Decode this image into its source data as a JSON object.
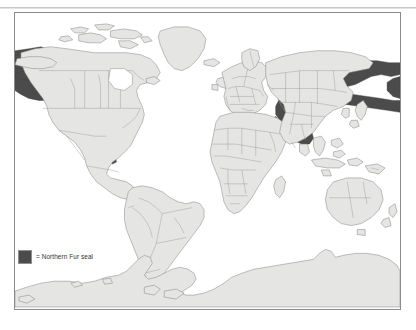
{
  "figure": {
    "kind": "distribution-map",
    "projection_note": "world map, cylindrical projection",
    "background_color": "#ffffff",
    "frame_border_color": "#8b8b8b"
  },
  "legend": {
    "swatch_color": "#4b4b4b",
    "swatch_border_color": "#8f8f8f",
    "equals_label": "=",
    "label": "Northern Fur seal",
    "full_text": "= Northern Fur seal"
  },
  "map": {
    "land_fill": "#e5e5e3",
    "land_stroke": "#8a8a8a",
    "border_stroke": "#9a9a9a",
    "ocean_fill": "#ffffff",
    "range_fill": "#4b4b4b",
    "range_stroke": "#3c3c3c",
    "regions_shaded": [
      "Bering Sea",
      "Aleutian Islands",
      "Gulf of Alaska",
      "Pacific coast of North America",
      "Sea of Okhotsk",
      "Kamchatka Peninsula",
      "Kuril Islands",
      "Sea of Japan",
      "Northwest Pacific"
    ],
    "continents": [
      "North America",
      "South America",
      "Greenland",
      "Europe",
      "Africa",
      "Asia",
      "Australia",
      "Antarctica"
    ]
  }
}
